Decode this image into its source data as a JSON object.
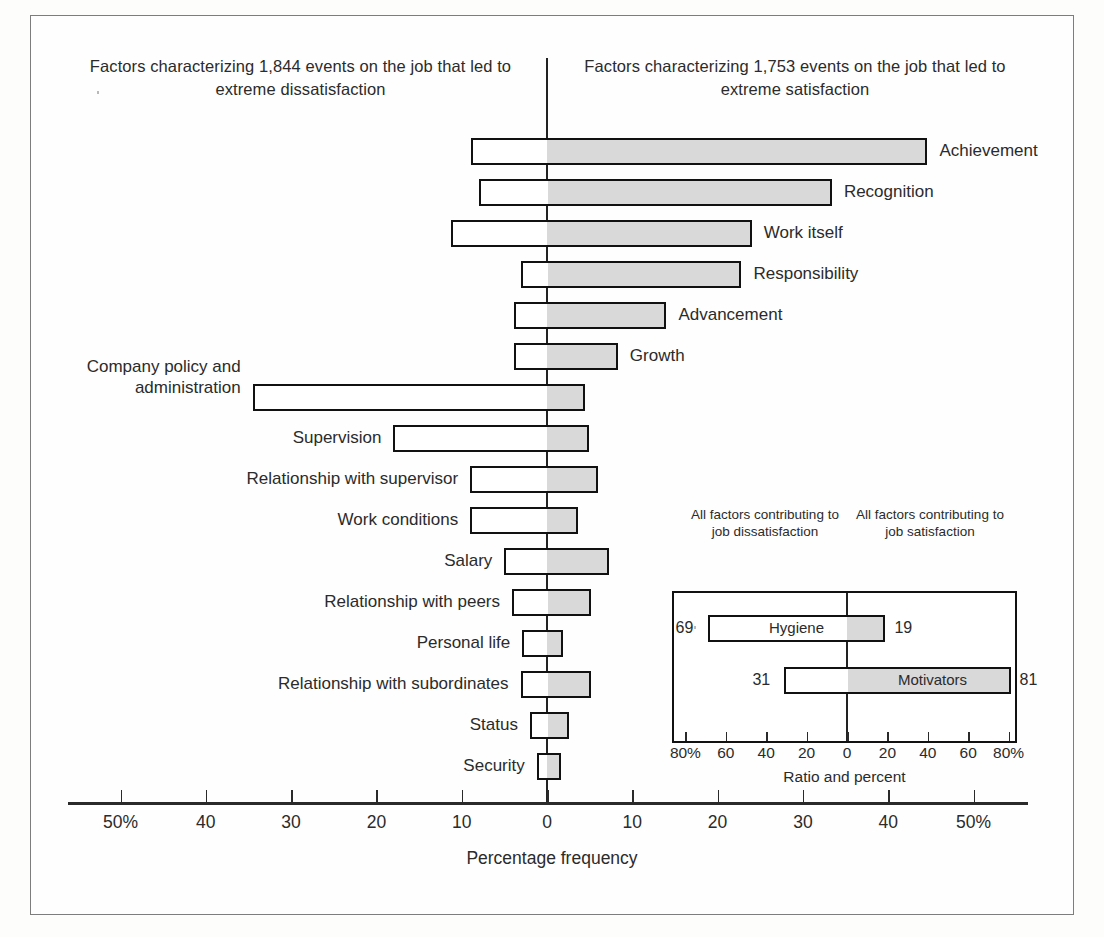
{
  "headers": {
    "left": "Factors characterizing 1,844 events on the job that led to extreme dissatisfaction",
    "right": "Factors characterizing 1,753 events on the job that led to extreme satisfaction"
  },
  "axis": {
    "title": "Percentage frequency",
    "ticks": [
      "50%",
      "40",
      "30",
      "20",
      "10",
      "0",
      "10",
      "20",
      "30",
      "40",
      "50%"
    ]
  },
  "inset": {
    "header_left": "All factors contributing to job dissatisfaction",
    "header_right": "All factors contributing to job satisfaction",
    "axis_title": "Ratio and percent",
    "ticks": [
      "80%",
      "60",
      "40",
      "20",
      "0",
      "20",
      "40",
      "60",
      "80%"
    ],
    "rows": [
      {
        "label": "Hygiene",
        "neg": 69,
        "pos": 19,
        "neg_text": "69",
        "pos_text": "19"
      },
      {
        "label": "Motivators",
        "neg": 31,
        "pos": 81,
        "neg_text": "31",
        "pos_text": "81"
      }
    ]
  },
  "chart_data": {
    "type": "bar",
    "orientation": "horizontal",
    "style": "diverging bidirectional (Herzberg two-factor theory)",
    "title": "",
    "xlabel": "Percentage frequency",
    "ylabel": "",
    "xlim": [
      -50,
      50
    ],
    "xticks": [
      -50,
      -40,
      -30,
      -20,
      -10,
      0,
      10,
      20,
      30,
      40,
      50
    ],
    "grid": false,
    "legend": "none",
    "categories": [
      "Achievement",
      "Recognition",
      "Work itself",
      "Responsibility",
      "Advancement",
      "Growth",
      "Company policy and administration",
      "Supervision",
      "Relationship with supervisor",
      "Work conditions",
      "Salary",
      "Relationship with peers",
      "Personal life",
      "Relationship with subordinates",
      "Status",
      "Security"
    ],
    "series": [
      {
        "name": "Dissatisfaction (left of zero)",
        "values": [
          8.9,
          8.0,
          11.3,
          3.0,
          3.9,
          3.9,
          34.5,
          18.0,
          9.0,
          9.0,
          5.0,
          4.1,
          2.9,
          3.1,
          2.0,
          1.2
        ]
      },
      {
        "name": "Satisfaction (right of zero)",
        "values": [
          44.6,
          33.4,
          24.0,
          22.8,
          14.0,
          8.3,
          4.4,
          4.9,
          6.0,
          3.6,
          7.3,
          5.2,
          1.9,
          5.2,
          2.6,
          1.6
        ]
      }
    ],
    "annotations": {
      "left_header": "Factors characterizing 1,844 events on the job that led to extreme dissatisfaction",
      "right_header": "Factors characterizing 1,753 events on the job that led to extreme satisfaction"
    },
    "inset_chart": {
      "type": "bar",
      "orientation": "horizontal",
      "xlabel": "Ratio and percent",
      "xlim": [
        -90,
        90
      ],
      "xticks": [
        -80,
        -60,
        -40,
        -20,
        0,
        20,
        40,
        60,
        80
      ],
      "categories": [
        "Hygiene",
        "Motivators"
      ],
      "series": [
        {
          "name": "Contributing to job dissatisfaction",
          "values": [
            69,
            31
          ]
        },
        {
          "name": "Contributing to job satisfaction",
          "values": [
            19,
            81
          ]
        }
      ]
    }
  },
  "rows": [
    {
      "label": "Achievement",
      "neg": 8.9,
      "pos": 44.6,
      "side": "right"
    },
    {
      "label": "Recognition",
      "neg": 8.0,
      "pos": 33.4,
      "side": "right"
    },
    {
      "label": "Work itself",
      "neg": 11.3,
      "pos": 24.0,
      "side": "right"
    },
    {
      "label": "Responsibility",
      "neg": 3.0,
      "pos": 22.8,
      "side": "right"
    },
    {
      "label": "Advancement",
      "neg": 3.9,
      "pos": 14.0,
      "side": "right"
    },
    {
      "label": "Growth",
      "neg": 3.9,
      "pos": 8.3,
      "side": "right"
    },
    {
      "label": "Company policy and administration",
      "neg": 34.5,
      "pos": 4.4,
      "side": "left",
      "multiline": true
    },
    {
      "label": "Supervision",
      "neg": 18.0,
      "pos": 4.9,
      "side": "left"
    },
    {
      "label": "Relationship with supervisor",
      "neg": 9.0,
      "pos": 6.0,
      "side": "left"
    },
    {
      "label": "Work conditions",
      "neg": 9.0,
      "pos": 3.6,
      "side": "left"
    },
    {
      "label": "Salary",
      "neg": 5.0,
      "pos": 7.3,
      "side": "left"
    },
    {
      "label": "Relationship with peers",
      "neg": 4.1,
      "pos": 5.2,
      "side": "left"
    },
    {
      "label": "Personal life",
      "neg": 2.9,
      "pos": 1.9,
      "side": "left"
    },
    {
      "label": "Relationship with subordinates",
      "neg": 3.1,
      "pos": 5.2,
      "side": "left"
    },
    {
      "label": "Status",
      "neg": 2.0,
      "pos": 2.6,
      "side": "left"
    },
    {
      "label": "Security",
      "neg": 1.2,
      "pos": 1.6,
      "side": "left"
    }
  ]
}
